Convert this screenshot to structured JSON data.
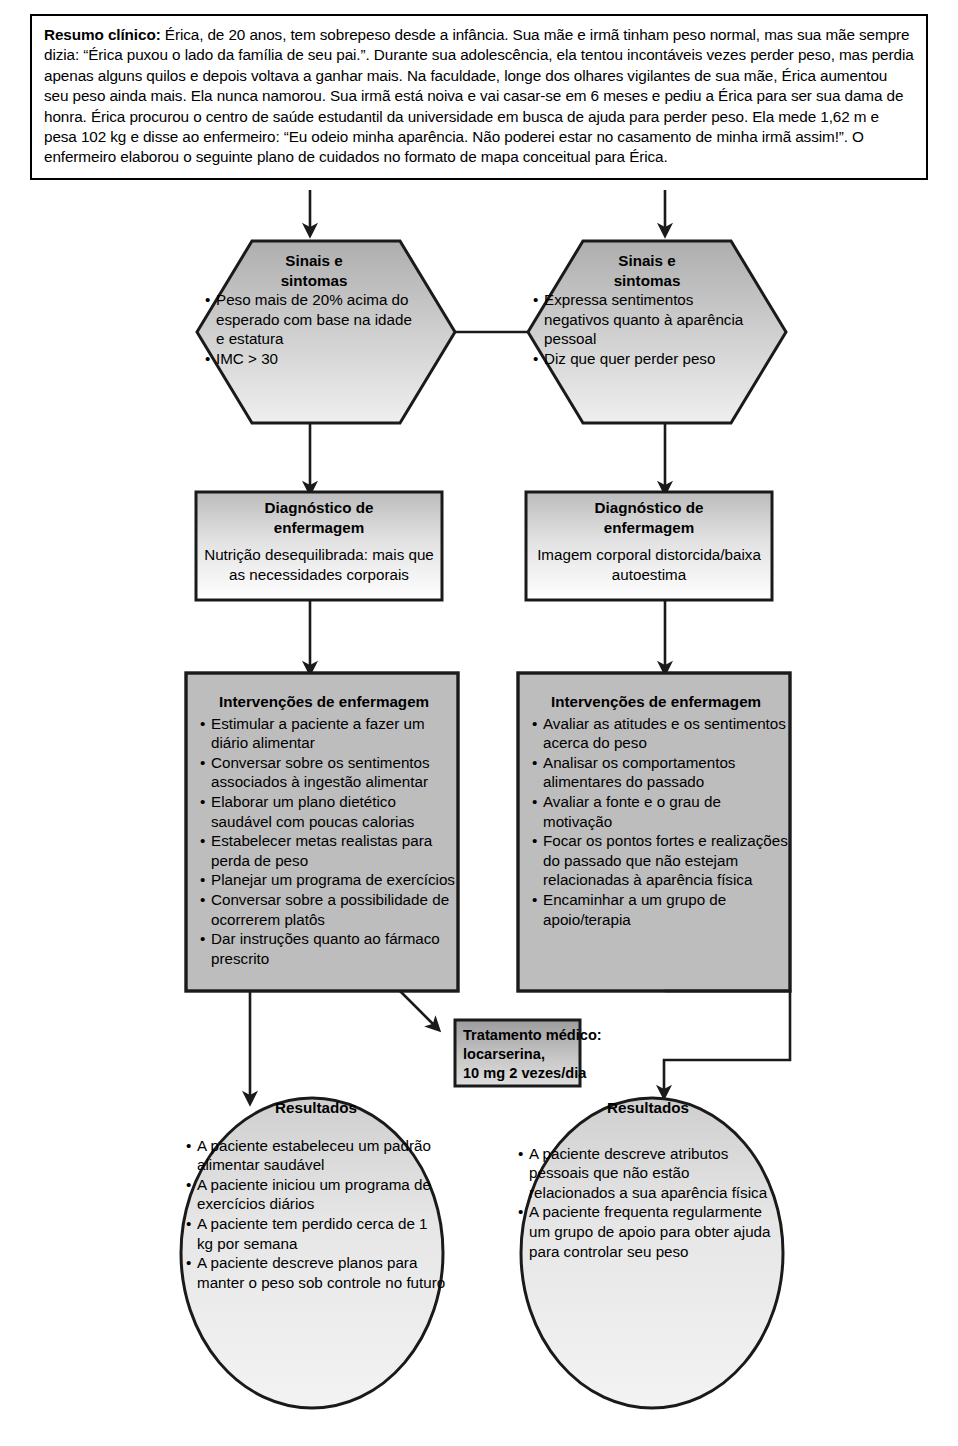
{
  "summary": {
    "label": "Resumo clínico:",
    "text": " Érica, de 20 anos, tem sobrepeso desde a infância. Sua mãe e irmã tinham peso normal, mas sua mãe sempre dizia: “Érica puxou o lado da família de seu pai.”. Durante sua adolescência, ela tentou incontáveis vezes perder peso, mas perdia apenas alguns quilos e depois voltava a ganhar mais. Na faculdade, longe dos olhares vigilantes de sua mãe, Érica aumentou seu peso ainda mais. Ela nunca namorou. Sua irmã está noiva e vai casar-se em 6 meses e pediu a Érica para ser sua dama de honra. Érica procurou o centro de saúde estudantil da universidade em busca de ajuda para perder peso. Ela mede 1,62 m e pesa 102 kg e disse ao enfermeiro: “Eu odeio minha aparência. Não poderei estar no casamento de minha irmã assim!”. O enfermeiro elaborou o seguinte plano de cuidados no formato de mapa conceitual para Érica."
  },
  "colors": {
    "shape_fill_top": "#b3b3b3",
    "shape_fill_bottom": "#e8e8e8",
    "intervention_fill": "#b8b8b8",
    "stroke": "#000000",
    "white": "#ffffff"
  },
  "nodes": {
    "signs_left": {
      "title_line1": "Sinais e",
      "title_line2": "sintomas",
      "bullets": [
        "Peso mais de 20% acima do esperado com base na idade e estatura",
        "IMC > 30"
      ]
    },
    "signs_right": {
      "title_line1": "Sinais e",
      "title_line2": "sintomas",
      "bullets": [
        "Expressa sentimentos negativos quanto à aparência pessoal",
        "Diz que quer perder peso"
      ]
    },
    "diagnosis_left": {
      "title_line1": "Diagnóstico de",
      "title_line2": "enfermagem",
      "body": "Nutrição desequilibrada: mais que as necessidades corporais"
    },
    "diagnosis_right": {
      "title_line1": "Diagnóstico de",
      "title_line2": "enfermagem",
      "body": "Imagem corporal distorcida/baixa autoestima"
    },
    "interventions_left": {
      "title": "Intervenções de enfermagem",
      "bullets": [
        "Estimular a paciente a fazer um diário alimentar",
        "Conversar sobre os sentimentos associados à ingestão alimentar",
        "Elaborar um plano dietético saudável com poucas calorias",
        "Estabelecer metas realistas para perda de peso",
        "Planejar um programa de exercícios",
        "Conversar sobre a possibilidade de ocorrerem platôs",
        "Dar instruções quanto ao fármaco prescrito"
      ]
    },
    "interventions_right": {
      "title": "Intervenções de enfermagem",
      "bullets": [
        "Avaliar as atitudes e os sentimentos acerca do peso",
        "Analisar os comportamentos alimentares do passado",
        "Avaliar a fonte e o grau de motivação",
        "Focar os pontos fortes e realizações do passado que não estejam relacionadas à aparência física",
        "Encaminhar a um grupo de apoio/terapia"
      ]
    },
    "treatment": {
      "line1": "Tratamento médico:",
      "line2": "locarserina,",
      "line3": "10 mg 2 vezes/dia"
    },
    "outcomes_left": {
      "title": "Resultados",
      "bullets": [
        "A paciente estabeleceu um padrão alimentar saudável",
        "A paciente iniciou um programa de exercícios diários",
        "A paciente tem perdido cerca de 1 kg por semana",
        "A paciente descreve planos para manter o peso sob controle no futuro"
      ]
    },
    "outcomes_right": {
      "title": "Resultados",
      "bullets": [
        "A paciente descreve atributos pessoais que não estão relacionados a sua aparência física",
        "A paciente frequenta regularmente um grupo de apoio para obter ajuda para controlar seu peso"
      ]
    }
  }
}
